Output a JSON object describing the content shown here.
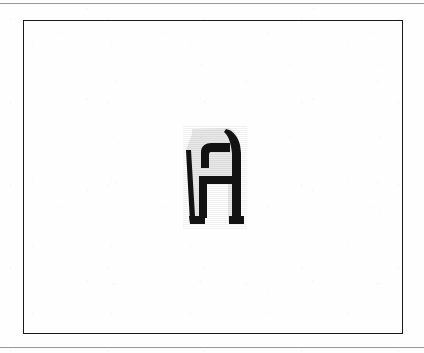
{
  "page": {
    "width": 424,
    "height": 353,
    "background_color": "#fefefe",
    "media": "scanned-document"
  },
  "rules": [
    {
      "name": "top-rule",
      "y": 3,
      "color": "#9a9a9a",
      "thickness": 1
    },
    {
      "name": "bottom-rule",
      "y": 347,
      "color": "#9a9a9a",
      "thickness": 1
    }
  ],
  "figure_frame": {
    "x": 23,
    "y": 20,
    "width": 380,
    "height": 314,
    "border_color": "#1a1a1a",
    "border_width": 1.6,
    "fill": "none"
  },
  "glyph": {
    "character": "A",
    "description": "stylized slab letter A with light gray fill and heavy black outline",
    "fill_color": "#e8e8e8",
    "stroke_color": "#121212",
    "bbox": {
      "x": 184,
      "y": 127,
      "width": 64,
      "height": 103
    },
    "features": [
      "rounded top-left shoulder",
      "curved top-right diagonal spine",
      "enclosed rectangular counter",
      "horizontal crossbar",
      "two feet separated by a gap"
    ]
  }
}
